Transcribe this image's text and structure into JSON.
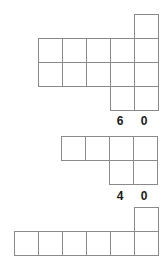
{
  "canvas": {
    "width": 164,
    "height": 271,
    "background": "#ffffff",
    "line_color": "#8a8a8a",
    "cell_fill": "#ffffff",
    "text_color": "#1a1a1a",
    "cell_size": 24
  },
  "figures": [
    {
      "id": "figure-1",
      "name": "top-grid-shape",
      "origin": {
        "x": 38,
        "y": 14
      },
      "grid_cols": 5,
      "grid_rows": 4,
      "cells": [
        {
          "col": 4,
          "row": 0
        },
        {
          "col": 0,
          "row": 1
        },
        {
          "col": 1,
          "row": 1
        },
        {
          "col": 2,
          "row": 1
        },
        {
          "col": 3,
          "row": 1
        },
        {
          "col": 4,
          "row": 1
        },
        {
          "col": 0,
          "row": 2
        },
        {
          "col": 1,
          "row": 2
        },
        {
          "col": 2,
          "row": 2
        },
        {
          "col": 3,
          "row": 2
        },
        {
          "col": 4,
          "row": 2
        },
        {
          "col": 3,
          "row": 3
        },
        {
          "col": 4,
          "row": 3
        }
      ],
      "labels": [
        {
          "text": "6",
          "x": 113,
          "y": 114
        },
        {
          "text": "0",
          "x": 137,
          "y": 114
        }
      ]
    },
    {
      "id": "figure-2",
      "name": "middle-grid-shape",
      "origin": {
        "x": 61,
        "y": 136
      },
      "grid_cols": 4,
      "grid_rows": 2,
      "cells": [
        {
          "col": 0,
          "row": 0
        },
        {
          "col": 1,
          "row": 0
        },
        {
          "col": 2,
          "row": 0
        },
        {
          "col": 3,
          "row": 0
        },
        {
          "col": 2,
          "row": 1
        },
        {
          "col": 3,
          "row": 1
        }
      ],
      "labels": [
        {
          "text": "4",
          "x": 113,
          "y": 189
        },
        {
          "text": "0",
          "x": 137,
          "y": 189
        }
      ]
    },
    {
      "id": "figure-3",
      "name": "bottom-grid-shape",
      "origin": {
        "x": 14,
        "y": 207
      },
      "grid_cols": 6,
      "grid_rows": 2,
      "cells": [
        {
          "col": 5,
          "row": 0
        },
        {
          "col": 0,
          "row": 1
        },
        {
          "col": 1,
          "row": 1
        },
        {
          "col": 2,
          "row": 1
        },
        {
          "col": 3,
          "row": 1
        },
        {
          "col": 4,
          "row": 1
        },
        {
          "col": 5,
          "row": 1
        }
      ],
      "labels": []
    }
  ]
}
